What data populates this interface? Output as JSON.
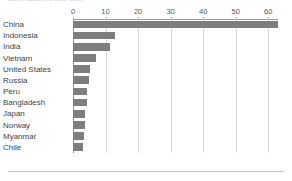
{
  "caption": {
    "text": "(cut-off caption text above chart)"
  },
  "chart_data": {
    "type": "bar",
    "orientation": "horizontal",
    "title": "",
    "subtitle": "",
    "xlabel": "",
    "ylabel": "",
    "xlim": [
      0,
      63
    ],
    "xticks": [
      0,
      10,
      20,
      30,
      40,
      50,
      60
    ],
    "xticklabels": [
      "0",
      "10",
      "20",
      "30",
      "40",
      "50",
      "60"
    ],
    "grid": "vertical",
    "legend": "none",
    "bar_color": "#7e7e7e",
    "gridline_color": "#d8d8d8",
    "axis_color": "#9a9a9a",
    "categories": [
      "China",
      "Indonesia",
      "India",
      "Vietnam",
      "United States",
      "Russia",
      "Peru",
      "Bangladesh",
      "Japan",
      "Norway",
      "Myanmar",
      "Chile"
    ],
    "values": [
      63,
      13,
      11.5,
      7,
      5.3,
      5,
      4.3,
      4.2,
      3.8,
      3.6,
      3.3,
      3.2
    ]
  }
}
